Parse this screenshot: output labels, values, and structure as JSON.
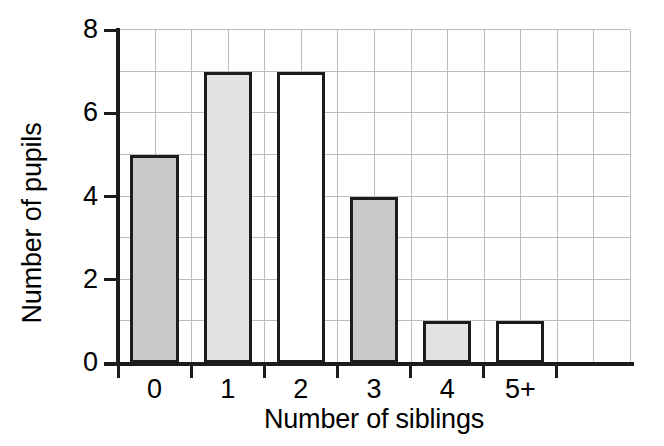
{
  "chart_data": {
    "type": "bar",
    "title": "",
    "xlabel": "Number of siblings",
    "ylabel": "Number of pupils",
    "categories": [
      "0",
      "1",
      "2",
      "3",
      "4",
      "5+"
    ],
    "values": [
      5,
      7,
      7,
      4,
      1,
      1
    ],
    "ylim": [
      0,
      8
    ],
    "y_ticks": [
      "0",
      "2",
      "4",
      "6",
      "8"
    ],
    "y_tick_values": [
      0,
      2,
      4,
      6,
      8
    ],
    "grid": "both-axes-light-gray",
    "legend": "none",
    "bar_fills": [
      "#c9c9c9",
      "#e2e2e2",
      "#ffffff",
      "#c9c9c9",
      "#e2e2e2",
      "#ffffff"
    ],
    "bar_edge_color": "#1c1c1c",
    "gridline_color": "#b9bcc0",
    "axis_color": "#1c1c1c",
    "background_color": "#ffffff"
  }
}
